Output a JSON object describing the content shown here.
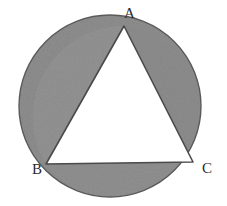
{
  "figure": {
    "kind": "geometry-diagram",
    "background_color": "#ffffff",
    "shaded_color": "#8f8f8f",
    "shaded_color_light": "#9a9a9a",
    "outline_color": "#4a4a4a",
    "triangle_fill": "#ffffff",
    "labels": {
      "apex": "A",
      "bottom_left": "B",
      "bottom_right": "C"
    },
    "circle": {
      "center_x": 110,
      "center_y": 106,
      "radius": 91
    },
    "triangle": {
      "vertex_a": {
        "x": 124,
        "y": 26
      },
      "vertex_b": {
        "x": 46,
        "y": 164
      },
      "vertex_c": {
        "x": 193,
        "y": 162
      }
    }
  }
}
